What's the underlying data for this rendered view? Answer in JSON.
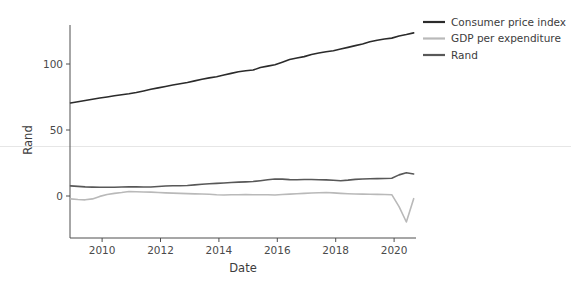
{
  "chart_data": {
    "type": "line",
    "title": "",
    "xlabel": "Date",
    "ylabel": "Rand",
    "xlim": [
      2008.9,
      2020.75
    ],
    "ylim": [
      -22,
      132
    ],
    "xticks": [
      2010,
      2012,
      2014,
      2016,
      2018,
      2020
    ],
    "xticklabels": [
      "2010",
      "2012",
      "2014",
      "2016",
      "2018",
      "2020"
    ],
    "yticks": [
      0,
      50,
      100
    ],
    "yticklabels": [
      "0",
      "50",
      "100"
    ],
    "grid": false,
    "legend_position": "upper right",
    "series": [
      {
        "name": "Consumer price index",
        "color": "#2b2b2b",
        "x": [
          2008.92,
          2009.17,
          2009.42,
          2009.67,
          2009.92,
          2010.17,
          2010.42,
          2010.67,
          2010.92,
          2011.17,
          2011.42,
          2011.67,
          2011.92,
          2012.17,
          2012.42,
          2012.67,
          2012.92,
          2013.17,
          2013.42,
          2013.67,
          2013.92,
          2014.17,
          2014.42,
          2014.67,
          2014.92,
          2015.17,
          2015.42,
          2015.67,
          2015.92,
          2016.17,
          2016.42,
          2016.67,
          2016.92,
          2017.17,
          2017.42,
          2017.67,
          2017.92,
          2018.17,
          2018.42,
          2018.67,
          2018.92,
          2019.17,
          2019.42,
          2019.67,
          2019.92,
          2020.17,
          2020.42,
          2020.67
        ],
        "y": [
          70.5,
          71.4,
          72.4,
          73.3,
          74.2,
          75.0,
          75.9,
          76.7,
          77.4,
          78.4,
          79.6,
          80.8,
          81.9,
          83.0,
          84.1,
          85.1,
          86.0,
          87.2,
          88.4,
          89.5,
          90.4,
          91.6,
          92.9,
          94.1,
          94.9,
          95.4,
          97.3,
          98.4,
          99.5,
          101.4,
          103.4,
          104.6,
          105.6,
          107.2,
          108.3,
          109.3,
          110.1,
          111.4,
          112.6,
          113.9,
          115.2,
          116.8,
          118.0,
          118.9,
          119.6,
          121.2,
          122.3,
          123.6
        ]
      },
      {
        "name": "GDP per expenditure",
        "color": "#b9b9b9",
        "x": [
          2008.92,
          2009.17,
          2009.42,
          2009.67,
          2009.92,
          2010.17,
          2010.42,
          2010.67,
          2010.92,
          2011.17,
          2011.42,
          2011.67,
          2011.92,
          2012.17,
          2012.42,
          2012.67,
          2012.92,
          2013.17,
          2013.42,
          2013.67,
          2013.92,
          2014.17,
          2014.42,
          2014.67,
          2014.92,
          2015.17,
          2015.42,
          2015.67,
          2015.92,
          2016.17,
          2016.42,
          2016.67,
          2016.92,
          2017.17,
          2017.42,
          2017.67,
          2017.92,
          2018.17,
          2018.42,
          2018.67,
          2018.92,
          2019.17,
          2019.42,
          2019.67,
          2019.92,
          2020.17,
          2020.42,
          2020.67
        ],
        "y": [
          -2.2,
          -2.7,
          -2.9,
          -2.2,
          -0.3,
          1.1,
          2.0,
          2.6,
          3.4,
          3.2,
          3.0,
          2.9,
          2.6,
          2.4,
          2.2,
          2.0,
          1.8,
          1.6,
          1.5,
          1.3,
          0.9,
          0.8,
          0.9,
          1.0,
          1.1,
          1.0,
          1.0,
          0.9,
          0.8,
          1.1,
          1.4,
          1.7,
          2.0,
          2.3,
          2.5,
          2.6,
          2.4,
          2.0,
          1.7,
          1.5,
          1.4,
          1.3,
          1.2,
          1.1,
          1.0,
          -8.0,
          -19.7,
          -2.0
        ]
      },
      {
        "name": "Rand",
        "color": "#585858",
        "x": [
          2008.92,
          2009.17,
          2009.42,
          2009.67,
          2009.92,
          2010.17,
          2010.42,
          2010.67,
          2010.92,
          2011.17,
          2011.42,
          2011.67,
          2011.92,
          2012.17,
          2012.42,
          2012.67,
          2012.92,
          2013.17,
          2013.42,
          2013.67,
          2013.92,
          2014.17,
          2014.42,
          2014.67,
          2014.92,
          2015.17,
          2015.42,
          2015.67,
          2015.92,
          2016.17,
          2016.42,
          2016.67,
          2016.92,
          2017.17,
          2017.42,
          2017.67,
          2017.92,
          2018.17,
          2018.42,
          2018.67,
          2018.92,
          2019.17,
          2019.42,
          2019.67,
          2019.92,
          2020.17,
          2020.42,
          2020.67
        ],
        "y": [
          7.7,
          7.3,
          6.9,
          6.7,
          6.6,
          6.6,
          6.6,
          6.8,
          7.0,
          6.9,
          6.8,
          6.8,
          7.2,
          7.6,
          7.8,
          7.8,
          7.9,
          8.4,
          8.9,
          9.3,
          9.6,
          9.9,
          10.2,
          10.5,
          10.7,
          11.0,
          11.6,
          12.3,
          12.9,
          12.8,
          12.4,
          12.3,
          12.5,
          12.5,
          12.3,
          12.2,
          11.9,
          11.6,
          12.0,
          12.6,
          12.9,
          13.1,
          13.2,
          13.3,
          13.5,
          16.0,
          17.6,
          16.7
        ]
      }
    ]
  },
  "axes": {
    "ylabel": "Rand",
    "xlabel": "Date",
    "yticklabels": [
      "100",
      "50",
      "0"
    ],
    "xticklabels": [
      "2010",
      "2012",
      "2014",
      "2016",
      "2018",
      "2020"
    ]
  },
  "legend": {
    "items": [
      {
        "label": "Consumer price index",
        "color": "#2b2b2b"
      },
      {
        "label": "GDP per expenditure",
        "color": "#b9b9b9"
      },
      {
        "label": "Rand",
        "color": "#585858"
      }
    ]
  }
}
